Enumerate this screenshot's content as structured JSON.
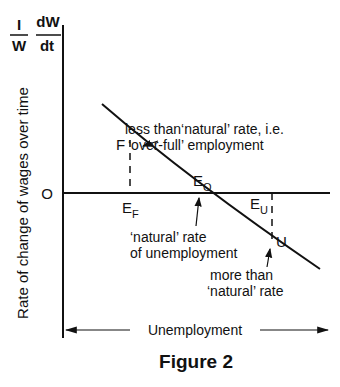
{
  "figure": {
    "caption": "Figure 2",
    "y_axis_symbol": {
      "numerator_left": "I",
      "denominator_left": "W",
      "numerator_right": "dW",
      "denominator_right": "dt"
    },
    "y_axis_label": "Rate of change of wages over time",
    "x_axis_label": "Unemployment",
    "origin_label": "O",
    "points": {
      "F": "F",
      "E_F": {
        "main": "E",
        "sub": "F"
      },
      "E_O": {
        "main": "E",
        "sub": "O"
      },
      "E_U": {
        "main": "E",
        "sub": "U"
      },
      "U": "U"
    },
    "annotations": {
      "over_full_line1": "less than‘natural’ rate, i.e.",
      "over_full_line2": "‘over-full’ employment",
      "natural_line1": "‘natural’ rate",
      "natural_line2": "of unemployment",
      "more_line1": "more than",
      "more_line2": "‘natural’ rate"
    }
  }
}
